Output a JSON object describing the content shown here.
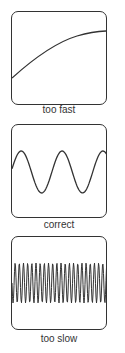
{
  "panels": [
    {
      "label": "too fast",
      "wave": "slow-curve"
    },
    {
      "label": "correct",
      "wave": "sine-2-cycles"
    },
    {
      "label": "too slow",
      "wave": "dense-sine"
    }
  ],
  "colors": {
    "stroke": "#333333",
    "background": "#ffffff"
  }
}
